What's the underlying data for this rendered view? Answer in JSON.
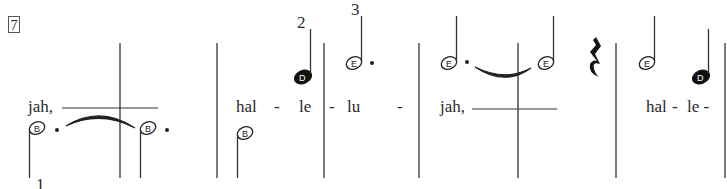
{
  "measure_number": "7",
  "finger_numbers": {
    "first": "1",
    "second": "2",
    "third": "3"
  },
  "notes": [
    {
      "letter": "B",
      "filled": false,
      "stem": "down",
      "dotted": true
    },
    {
      "letter": "B",
      "filled": false,
      "stem": "down",
      "dotted": true
    },
    {
      "letter": "B",
      "filled": false,
      "stem": "down",
      "dotted": false
    },
    {
      "letter": "D",
      "filled": true,
      "stem": "up",
      "dotted": false
    },
    {
      "letter": "E",
      "filled": false,
      "stem": "up",
      "dotted": true
    },
    {
      "letter": "E",
      "filled": false,
      "stem": "up",
      "dotted": true
    },
    {
      "letter": "E",
      "filled": false,
      "stem": "up",
      "dotted": false
    },
    {
      "letter": "E",
      "filled": false,
      "stem": "up",
      "dotted": false
    },
    {
      "letter": "D",
      "filled": true,
      "stem": "up",
      "dotted": false
    }
  ],
  "lyrics": {
    "s1": "jah,",
    "s2": "hal",
    "s3": "-",
    "s4": "le",
    "s5": "-",
    "s6": "lu",
    "s7": "-",
    "s8": "jah,",
    "s9": "hal",
    "s10": "-",
    "s11": "le -"
  },
  "colors": {
    "ink": "#2a2a2a",
    "paper": "#ffffff"
  }
}
